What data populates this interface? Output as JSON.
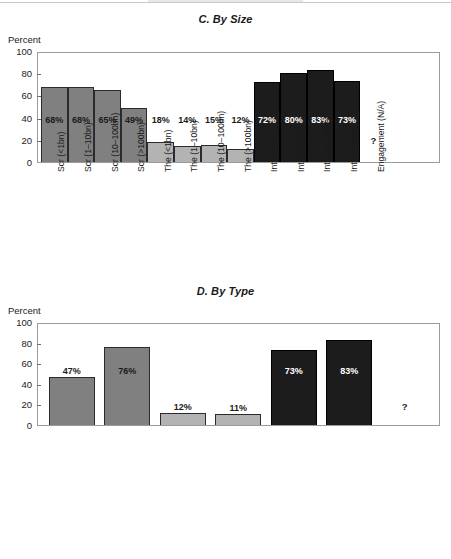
{
  "charts": {
    "c": {
      "title": "C. By Size",
      "y_axis_caption": "Percent",
      "unknown_marker": "?",
      "ytick_labels": [
        "100",
        "80",
        "60",
        "40",
        "20",
        "0"
      ]
    },
    "d": {
      "title": "D. By Type",
      "y_axis_caption": "Percent",
      "unknown_marker": "?",
      "ytick_labels": [
        "100",
        "80",
        "60",
        "40",
        "20",
        "0"
      ]
    }
  },
  "chart_data": [
    {
      "type": "bar",
      "title": "C. By Size",
      "xlabel": "",
      "ylabel": "Percent",
      "ylim": [
        0,
        100
      ],
      "yticks": [
        0,
        20,
        40,
        60,
        80,
        100
      ],
      "grid": false,
      "legend": "none",
      "categories": [
        "Scr (<1bn)",
        "Scr (1–10bn)",
        "Scr (10–100bn)",
        "Scr (>100bn)",
        "The (<1bn)",
        "The (1–10bn)",
        "The (10–100bn)",
        "The (>100bn)",
        "Int (<1bn)",
        "Int (1–10bn)",
        "Int (10–100bn)",
        "Int (>100bn)",
        "Engagement (N/A)"
      ],
      "values": [
        68,
        68,
        65,
        49,
        18,
        14,
        15,
        12,
        72,
        80,
        83,
        73,
        null
      ],
      "data_labels": [
        "68%",
        "68%",
        "65%",
        "49%",
        "18%",
        "14%",
        "15%",
        "12%",
        "72%",
        "80%",
        "83%",
        "73%",
        "?"
      ],
      "groups": [
        "Screening",
        "Screening",
        "Screening",
        "Screening",
        "Thematic",
        "Thematic",
        "Thematic",
        "Thematic",
        "Integration",
        "Integration",
        "Integration",
        "Integration",
        "Engagement"
      ],
      "group_colors": {
        "Screening": "#808080",
        "Thematic": "#b3b3b3",
        "Integration": "#1c1c1c",
        "Engagement": "#ffffff"
      },
      "annotations": [
        "Engagement value not available (N/A), shown as ?"
      ]
    },
    {
      "type": "bar",
      "title": "D. By Type",
      "xlabel": "",
      "ylabel": "Percent",
      "ylim": [
        0,
        100
      ],
      "yticks": [
        0,
        20,
        40,
        60,
        80,
        100
      ],
      "grid": false,
      "legend": "none",
      "categories": [
        "Scr (Investment Manager)",
        "Scr (Asset Owner)",
        "The (Investment Manager)",
        "The (Asset Owner)",
        "Int (Investment Manager)",
        "Int (Asset Owner)",
        "Engagement"
      ],
      "values": [
        47,
        76,
        12,
        11,
        73,
        83,
        null
      ],
      "data_labels": [
        "47%",
        "76%",
        "12%",
        "11%",
        "73%",
        "83%",
        "?"
      ],
      "groups": [
        "Screening",
        "Screening",
        "Thematic",
        "Thematic",
        "Integration",
        "Integration",
        "Engagement"
      ],
      "group_colors": {
        "Screening": "#808080",
        "Thematic": "#b3b3b3",
        "Integration": "#1c1c1c",
        "Engagement": "#ffffff"
      },
      "annotations": [
        "Engagement value not available, shown as ?"
      ]
    }
  ]
}
